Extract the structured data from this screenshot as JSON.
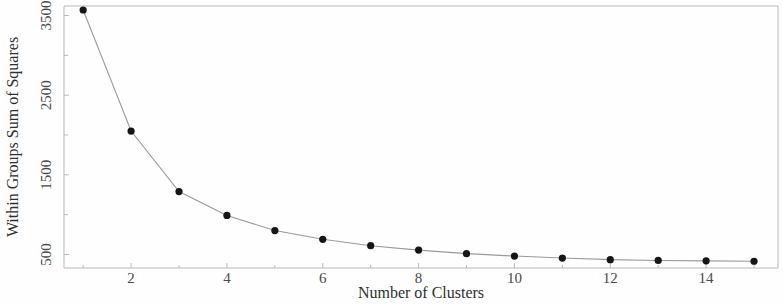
{
  "chart_data": {
    "type": "line",
    "title": "",
    "subtitle": "",
    "xlabel": "Number of Clusters",
    "ylabel": "Within Groups Sum of Squares",
    "x": [
      1,
      2,
      3,
      4,
      5,
      6,
      7,
      8,
      9,
      10,
      11,
      12,
      13,
      14,
      15
    ],
    "values": [
      3570,
      2050,
      1290,
      990,
      800,
      690,
      610,
      555,
      510,
      480,
      455,
      435,
      425,
      420,
      415
    ],
    "series": [
      {
        "name": "Within groups sum of squares",
        "values": [
          3570,
          2050,
          1290,
          990,
          800,
          690,
          610,
          555,
          510,
          480,
          455,
          435,
          425,
          420,
          415
        ]
      }
    ],
    "xlim": [
      0.6,
      15.5
    ],
    "ylim": [
      330,
      3620
    ],
    "xticks": [
      2,
      4,
      6,
      8,
      10,
      12,
      14
    ],
    "xticklabels": [
      "2",
      "4",
      "6",
      "8",
      "10",
      "12",
      "14"
    ],
    "yticks": [
      500,
      1500,
      2500,
      3500
    ],
    "yticklabels": [
      "500",
      "1500",
      "2500",
      "3500"
    ],
    "grid": false,
    "legend": null,
    "legend_position": "none",
    "marker": "filled-circle",
    "marker_color": "#151515",
    "line_color": "#9a9a9a",
    "frame_color": "#b9b9b9",
    "background": "#fefefe",
    "annotations": []
  },
  "axes": {
    "x_title": "Number of Clusters",
    "y_title": "Within Groups Sum of Squares"
  }
}
